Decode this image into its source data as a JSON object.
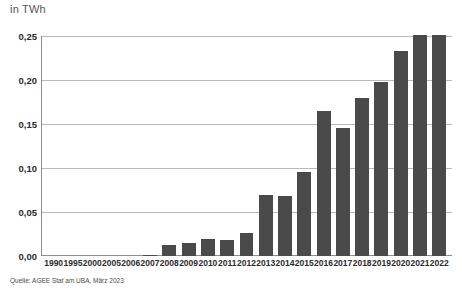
{
  "chart_data": {
    "type": "bar",
    "title": "in TWh",
    "xlabel": "",
    "ylabel": "in TWh",
    "ylim": [
      0,
      0.25
    ],
    "grid": true,
    "legend": "none",
    "y_ticks": [
      "0,00",
      "0,05",
      "0,10",
      "0,15",
      "0,20",
      "0,25"
    ],
    "y_tick_values": [
      0,
      0.05,
      0.1,
      0.15,
      0.2,
      0.25
    ],
    "categories": [
      "1990",
      "1995",
      "2000",
      "2005",
      "2006",
      "2007",
      "2008",
      "2009",
      "2010",
      "2011",
      "2012",
      "2013",
      "2014",
      "2015",
      "2016",
      "2017",
      "2018",
      "2019",
      "2020",
      "2021",
      "2022"
    ],
    "values": [
      0,
      0,
      0,
      0,
      0,
      0.001,
      0.013,
      0.015,
      0.019,
      0.018,
      0.026,
      0.069,
      0.068,
      0.095,
      0.165,
      0.145,
      0.18,
      0.198,
      0.233,
      0.251,
      0.251
    ],
    "bar_color": "#4a4a4a",
    "gridline_color": "#b9b9b9",
    "axis_color": "#8d8d8d",
    "source": "Quelle: AGEE Stat am UBA, März 2023"
  }
}
